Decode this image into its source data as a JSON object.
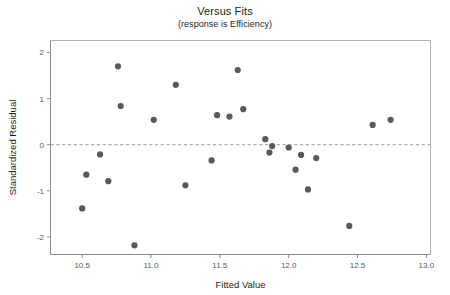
{
  "chart_data": {
    "type": "scatter",
    "title": "Versus Fits",
    "subtitle": "(response is Efficiency)",
    "xlabel": "Fitted Value",
    "ylabel": "Standardized Residual",
    "xlim": [
      10.27,
      13.03
    ],
    "ylim": [
      -2.38,
      2.26
    ],
    "xticks": [
      "10.5",
      "11.0",
      "11.5",
      "12.0",
      "12.5",
      "13.0"
    ],
    "xtick_values": [
      10.5,
      11.0,
      11.5,
      12.0,
      12.5,
      13.0
    ],
    "yticks": [
      "2",
      "1",
      "0",
      "-1",
      "-2"
    ],
    "ytick_values": [
      2,
      1,
      0,
      -1,
      -2
    ],
    "grid": false,
    "legend": "none",
    "reference_line": {
      "orientation": "horizontal",
      "value": 0,
      "style": "dashed"
    },
    "marker": {
      "shape": "circle",
      "color": "#58595b",
      "radius": 3.1
    },
    "points": [
      {
        "x": 10.5,
        "y": -1.38
      },
      {
        "x": 10.53,
        "y": -0.65
      },
      {
        "x": 10.63,
        "y": -0.21
      },
      {
        "x": 10.69,
        "y": -0.79
      },
      {
        "x": 10.76,
        "y": 1.7
      },
      {
        "x": 10.78,
        "y": 0.84
      },
      {
        "x": 10.88,
        "y": -2.18
      },
      {
        "x": 11.02,
        "y": 0.54
      },
      {
        "x": 11.18,
        "y": 1.3
      },
      {
        "x": 11.25,
        "y": -0.88
      },
      {
        "x": 11.44,
        "y": -0.34
      },
      {
        "x": 11.48,
        "y": 0.64
      },
      {
        "x": 11.57,
        "y": 0.61
      },
      {
        "x": 11.63,
        "y": 1.62
      },
      {
        "x": 11.67,
        "y": 0.77
      },
      {
        "x": 11.83,
        "y": 0.12
      },
      {
        "x": 11.86,
        "y": -0.17
      },
      {
        "x": 11.88,
        "y": -0.03
      },
      {
        "x": 12.0,
        "y": -0.06
      },
      {
        "x": 12.05,
        "y": -0.54
      },
      {
        "x": 12.09,
        "y": -0.22
      },
      {
        "x": 12.14,
        "y": -0.97
      },
      {
        "x": 12.2,
        "y": -0.29
      },
      {
        "x": 12.44,
        "y": -1.76
      },
      {
        "x": 12.61,
        "y": 0.43
      },
      {
        "x": 12.74,
        "y": 0.54
      }
    ]
  }
}
